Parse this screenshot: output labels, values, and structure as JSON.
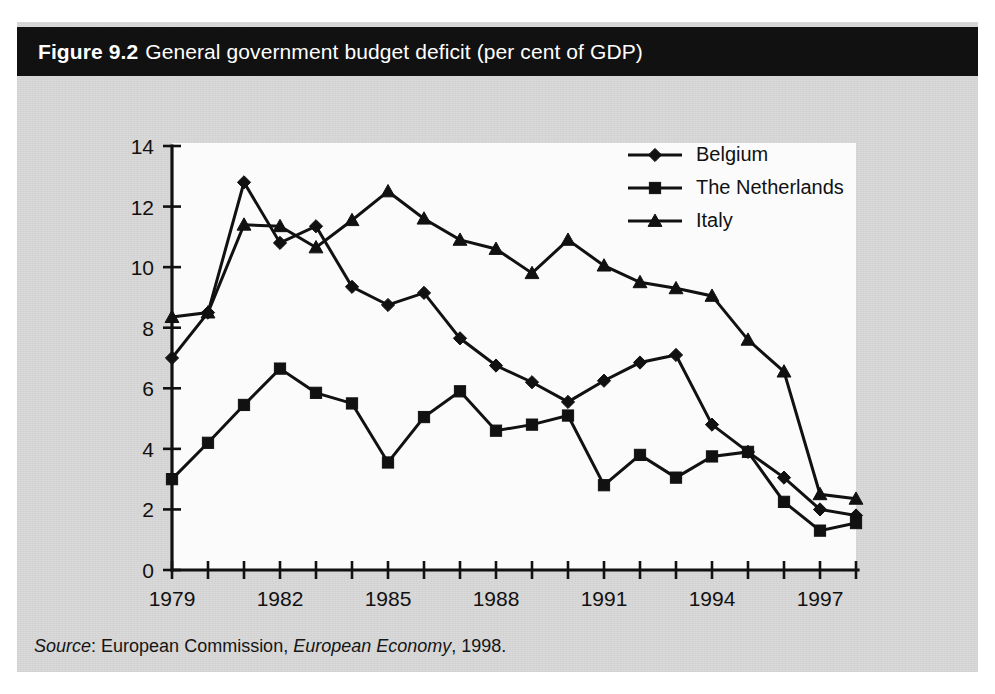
{
  "figure": {
    "label": "Figure 9.2",
    "title": "General government budget deficit (per cent of GDP)",
    "banner_color": "#111111",
    "banner_text_color": "#ffffff",
    "paper_color": "#d8d8d8",
    "plot_background": "#fbfbfb"
  },
  "source": {
    "prefix": "Source",
    "separator": ": ",
    "publisher": "European Commission, ",
    "publication": "European Economy",
    "year": ", 1998."
  },
  "chart_data": {
    "type": "line",
    "title": "General government budget deficit (per cent of GDP)",
    "xlabel": "",
    "ylabel": "",
    "ylim": [
      0,
      14
    ],
    "ytick_step": 2,
    "yticks": [
      0,
      2,
      4,
      6,
      8,
      10,
      12,
      14
    ],
    "ytick_labels": [
      "0",
      "2",
      "4",
      "6",
      "8",
      "10",
      "12",
      "14"
    ],
    "grid": false,
    "legend_position": "top-right",
    "x": [
      1979,
      1980,
      1981,
      1982,
      1983,
      1984,
      1985,
      1986,
      1987,
      1988,
      1989,
      1990,
      1991,
      1992,
      1993,
      1994,
      1995,
      1996,
      1997,
      1998
    ],
    "xticks": [
      1979,
      1980,
      1981,
      1982,
      1983,
      1984,
      1985,
      1986,
      1987,
      1988,
      1989,
      1990,
      1991,
      1992,
      1993,
      1994,
      1995,
      1996,
      1997,
      1998
    ],
    "xtick_labels_shown": [
      "1979",
      "1982",
      "1985",
      "1988",
      "1991",
      "1994",
      "1997"
    ],
    "xtick_labeled_years": [
      1979,
      1982,
      1985,
      1988,
      1991,
      1994,
      1997
    ],
    "series": [
      {
        "name": "Belgium",
        "marker": "diamond",
        "color": "#111111",
        "values": [
          7.0,
          8.5,
          12.8,
          10.8,
          11.35,
          9.35,
          8.75,
          9.15,
          7.65,
          6.75,
          6.2,
          5.55,
          6.25,
          6.85,
          7.1,
          4.8,
          3.9,
          3.05,
          2.0,
          1.8
        ]
      },
      {
        "name": "The Netherlands",
        "marker": "square",
        "color": "#111111",
        "values": [
          3.0,
          4.2,
          5.45,
          6.65,
          5.85,
          5.5,
          3.55,
          5.05,
          5.9,
          4.6,
          4.8,
          5.1,
          2.8,
          3.8,
          3.05,
          3.75,
          3.9,
          2.25,
          1.3,
          1.55
        ]
      },
      {
        "name": "Italy",
        "marker": "triangle",
        "color": "#111111",
        "values": [
          8.35,
          8.5,
          11.4,
          11.35,
          10.65,
          11.55,
          12.5,
          11.6,
          10.9,
          10.6,
          9.8,
          10.9,
          10.05,
          9.5,
          9.3,
          9.05,
          7.6,
          6.55,
          2.5,
          2.35
        ]
      }
    ]
  }
}
